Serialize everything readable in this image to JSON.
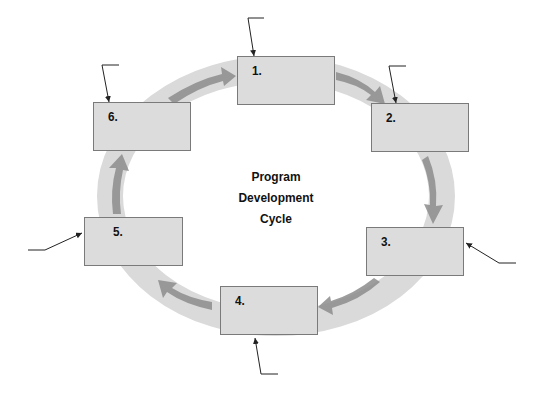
{
  "diagram": {
    "title_lines": [
      "Program",
      "Development",
      "Cycle"
    ],
    "steps": [
      {
        "label": "1.",
        "value": ""
      },
      {
        "label": "2.",
        "value": ""
      },
      {
        "label": "3.",
        "value": ""
      },
      {
        "label": "4.",
        "value": ""
      },
      {
        "label": "5.",
        "value": ""
      },
      {
        "label": "6.",
        "value": ""
      }
    ],
    "colors": {
      "ring": "#d9d9d9",
      "arrow": "#8a8a8a",
      "box_fill": "#dcdcdc",
      "box_border": "#7a7a7a",
      "leader_line": "#222222"
    }
  }
}
